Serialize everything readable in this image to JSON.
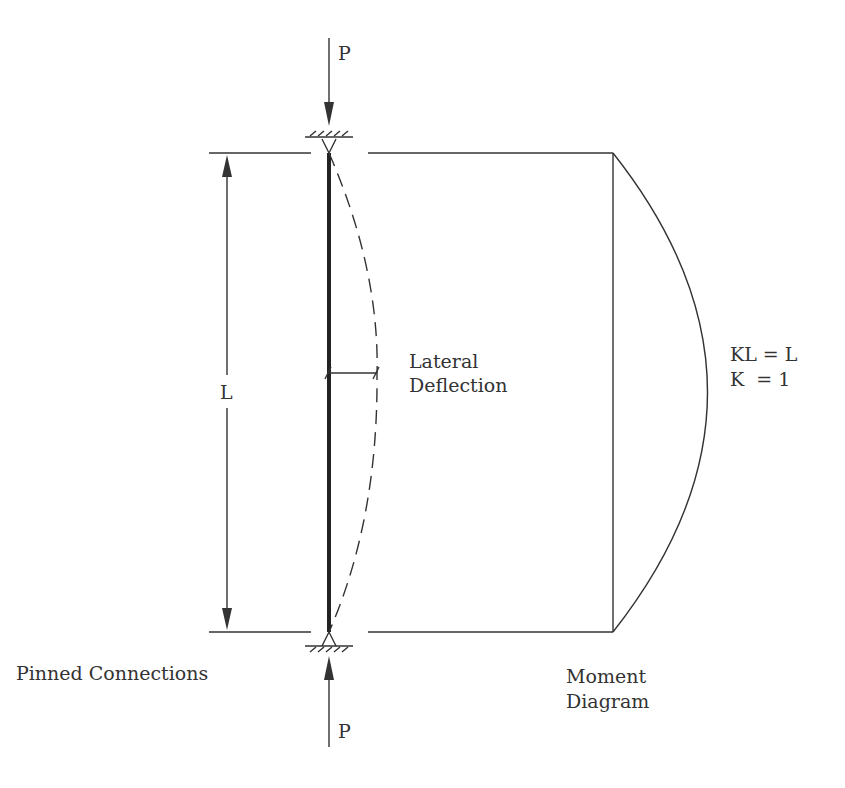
{
  "diagram": {
    "labels": {
      "load_top": "P",
      "load_bottom": "P",
      "length": "L",
      "deflection_line1": "Lateral",
      "deflection_line2": "Deflection",
      "effective_length_line1": "KL = L",
      "effective_length_line2": "K  = 1",
      "supports": "Pinned Connections",
      "moment_line1": "Moment",
      "moment_line2": "Diagram"
    },
    "colors": {
      "ink": "#333333",
      "background": "#ffffff"
    }
  }
}
